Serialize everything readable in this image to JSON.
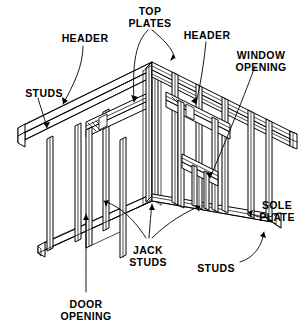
{
  "figure": {
    "kind": "isometric-line-diagram",
    "background_color": "#ffffff",
    "line_color": "#000000"
  },
  "labels": [
    {
      "id": "top-plates",
      "text": "TOP\nPLATES",
      "x": 150,
      "y": 6,
      "align": "center"
    },
    {
      "id": "header-left",
      "text": "HEADER",
      "x": 85,
      "y": 33,
      "align": "center"
    },
    {
      "id": "header-right",
      "text": "HEADER",
      "x": 207,
      "y": 30,
      "align": "center"
    },
    {
      "id": "window-opening",
      "text": "WINDOW\nOPENING",
      "x": 261,
      "y": 50,
      "align": "center"
    },
    {
      "id": "studs-left",
      "text": "STUDS",
      "x": 44,
      "y": 88,
      "align": "center"
    },
    {
      "id": "sole-plate",
      "text": "SOLE\nPLATE",
      "x": 281,
      "y": 200,
      "align": "center"
    },
    {
      "id": "jack-studs",
      "text": "JACK\nSTUDS",
      "x": 148,
      "y": 245,
      "align": "center"
    },
    {
      "id": "studs-right",
      "text": "STUDS",
      "x": 216,
      "y": 263,
      "align": "center"
    },
    {
      "id": "door-opening",
      "text": "DOOR\nOPENING",
      "x": 86,
      "y": 299,
      "align": "center"
    }
  ],
  "parts": [
    {
      "name": "top-plates",
      "description": "Doubled horizontal plates along the top of both walls, lapped at the corner"
    },
    {
      "name": "corner-post",
      "description": "Built-up vertical post at the wall corner"
    },
    {
      "name": "headers",
      "description": "Built-up beams spanning the door and window openings"
    },
    {
      "name": "studs",
      "description": "Regular vertical framing members"
    },
    {
      "name": "jack-studs",
      "description": "Shortened studs supporting the header ends"
    },
    {
      "name": "sole-plate",
      "description": "Horizontal plate at the base of the walls"
    },
    {
      "name": "window-sill",
      "description": "Horizontal sill with cripple studs below the window"
    },
    {
      "name": "door-opening",
      "description": "Framed opening in the left wall reaching the sole plate"
    },
    {
      "name": "window-opening",
      "description": "Framed opening in the right wall above the sill"
    }
  ]
}
